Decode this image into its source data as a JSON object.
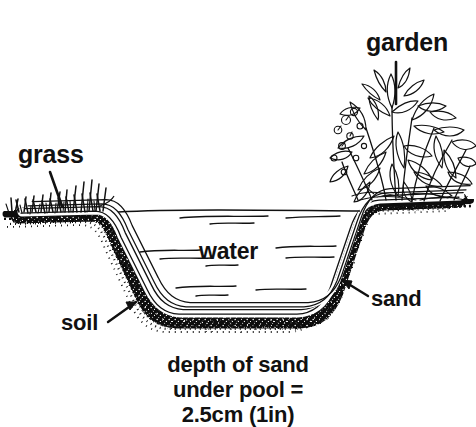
{
  "figure": {
    "type": "cross-section-diagram",
    "style": "black-and-white line drawing",
    "colors": {
      "ink": "#111111",
      "paper": "#ffffff",
      "soil_fill": "#1a1a1a",
      "sand_fill": "#ffffff",
      "water_fill": "#ffffff"
    }
  },
  "labels": {
    "grass": "grass",
    "garden": "garden",
    "water": "water",
    "sand": "sand",
    "soil": "soil"
  },
  "caption": {
    "line1": "depth of sand",
    "line2": "under pool =",
    "line3": "2.5cm (1in)"
  },
  "elements": {
    "grass_tufts": "grass-tufts",
    "garden_foliage": "garden-foliage",
    "soil_band": "soil-band",
    "sand_layer": "sand-layer",
    "pool_liner": "pool-liner",
    "water_surface": "water-surface-line",
    "water_ripples": "water-ripple-marks",
    "leader_grass": "leader-line-grass",
    "leader_garden": "leader-line-garden",
    "leader_sand": "leader-line-sand",
    "leader_soil": "leader-line-soil"
  }
}
